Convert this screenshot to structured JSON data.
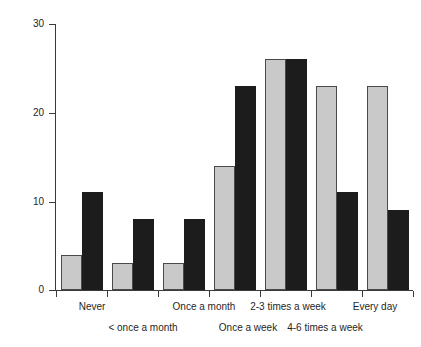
{
  "chart_data": {
    "type": "bar",
    "title": "",
    "subtitle": "",
    "xlabel": "",
    "ylabel": "Per cent",
    "ylim": [
      0,
      30
    ],
    "yticks": [
      0,
      10,
      20,
      30
    ],
    "ytick_labels": [
      "0",
      "10",
      "20",
      "30"
    ],
    "grid": false,
    "legend": "none",
    "categories": [
      "Never",
      "< once a month",
      "Once a month",
      "Once a week",
      "2-3 times a week",
      "4-6 times a week",
      "Every day"
    ],
    "series": [
      {
        "name": "series-light",
        "color": "#c9c9c9",
        "values": [
          4,
          3,
          3,
          14,
          26,
          23,
          23
        ]
      },
      {
        "name": "series-dark",
        "color": "#1c1c1c",
        "values": [
          11,
          8,
          8,
          23,
          26,
          11,
          9
        ]
      }
    ]
  },
  "axis": {
    "y_title": "Per cent",
    "y_labels": [
      "30",
      "20",
      "10",
      "0"
    ]
  },
  "x_labels": {
    "top_row": [
      "Never",
      "Once a month",
      "2-3 times a week",
      "Every day"
    ],
    "bottom_row": [
      "< once a month",
      "Once a week",
      "4-6 times a week"
    ]
  }
}
